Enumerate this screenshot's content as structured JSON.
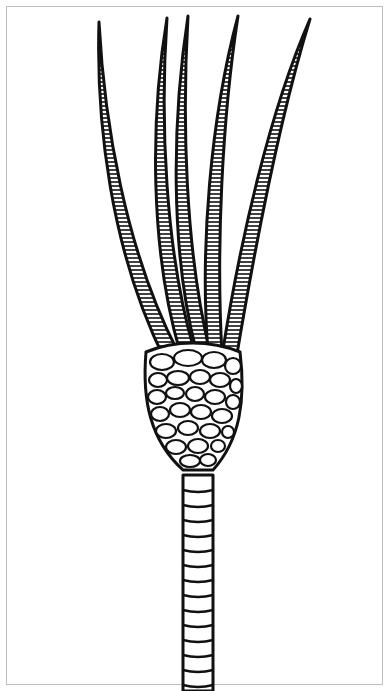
{
  "figure": {
    "stroke_color": "#111111",
    "background": "#ffffff",
    "frame_color": "#bdbdbd",
    "parts": [
      "arms",
      "calyx",
      "stem"
    ],
    "arm_count": 5
  }
}
